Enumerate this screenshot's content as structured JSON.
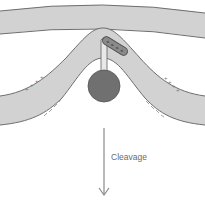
{
  "diagram": {
    "labels": {
      "cleavage": "Cleavage"
    },
    "charges": {
      "positive_symbol": "+",
      "negative_symbol": "–",
      "left_positive": "++++",
      "right_positive": "++++",
      "capsule_positive": "++++"
    },
    "colors": {
      "membrane_fill": "#d2d2d2",
      "membrane_stroke": "#6e6e6e",
      "stalk_fill": "#e8e8e8",
      "ball_fill": "#707070",
      "capsule_fill": "#8a8a8a",
      "arrow_color": "#8a8a8a",
      "background": "#ffffff"
    },
    "elements": [
      "upper-membrane",
      "curved-lower-membrane",
      "protein-stalk",
      "protein-globular-domain",
      "charged-helix",
      "cleavage-arrow"
    ]
  }
}
